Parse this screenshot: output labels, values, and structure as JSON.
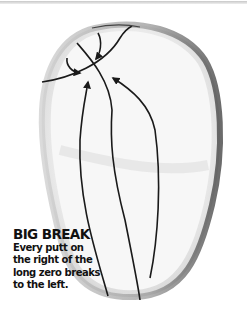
{
  "caption": {
    "title": "BIG BREAK",
    "body": "Every putt on the right of the long zero breaks to the left."
  },
  "diagram": {
    "elements": [
      "green-outline",
      "tier-ridge-line",
      "long-zero-line",
      "putt-path-left",
      "putt-path-right",
      "short-break-arrows"
    ],
    "colors": {
      "line": "#1a1a1a",
      "green_fill": "#f2f2f2",
      "green_edge": "#7a7a7a",
      "background": "#ffffff"
    }
  }
}
